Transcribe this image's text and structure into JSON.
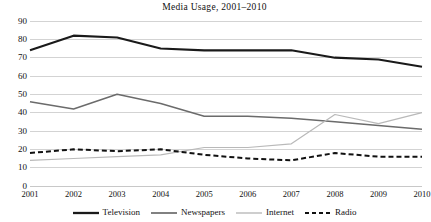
{
  "chart_data": {
    "type": "line",
    "title": "Media  Usage, 2001–2010",
    "xlabel": "",
    "ylabel": "",
    "x": [
      "2001",
      "2002",
      "2003",
      "2004",
      "2005",
      "2006",
      "2007",
      "2008",
      "2009",
      "2010"
    ],
    "categories": [
      "2001",
      "2002",
      "2003",
      "2004",
      "2005",
      "2006",
      "2007",
      "2008",
      "2009",
      "2010"
    ],
    "ylim": [
      0,
      90
    ],
    "yticks": [
      0,
      10,
      20,
      30,
      40,
      50,
      60,
      70,
      80,
      90
    ],
    "grid": "horizontal",
    "legend_position": "bottom",
    "series": [
      {
        "name": "Television",
        "values": [
          74,
          82,
          81,
          75,
          74,
          74,
          74,
          70,
          69,
          65
        ],
        "color": "#1a1a1a",
        "width": 2.1,
        "dash": "none"
      },
      {
        "name": "Newspapers",
        "values": [
          46,
          42,
          50,
          45,
          38,
          38,
          37,
          35,
          33,
          31
        ],
        "color": "#6b6b6b",
        "width": 1.5,
        "dash": "none"
      },
      {
        "name": "Internet",
        "values": [
          14,
          15,
          16,
          17,
          21,
          21,
          23,
          39,
          34,
          40
        ],
        "color": "#b9b9b9",
        "width": 1.2,
        "dash": "none"
      },
      {
        "name": "Radio",
        "values": [
          18,
          20,
          19,
          20,
          17,
          15,
          14,
          18,
          16,
          16
        ],
        "color": "#111111",
        "width": 2.0,
        "dash": "5,3"
      }
    ]
  },
  "axis": {
    "y_tick_labels": [
      "90",
      "80",
      "70",
      "60",
      "50",
      "40",
      "30",
      "20",
      "10",
      "0"
    ],
    "x_tick_labels": [
      "2001",
      "2002",
      "2003",
      "2004",
      "2005",
      "2006",
      "2007",
      "2008",
      "2009",
      "2010"
    ]
  },
  "legend": {
    "items": [
      {
        "label": "Television"
      },
      {
        "label": "Newspapers"
      },
      {
        "label": "Internet"
      },
      {
        "label": "Radio"
      }
    ]
  },
  "colors": {
    "television": "#1a1a1a",
    "newspapers": "#6b6b6b",
    "internet": "#b9b9b9",
    "radio": "#111111",
    "gridline": "#c8c8c8",
    "background": "#ffffff"
  }
}
